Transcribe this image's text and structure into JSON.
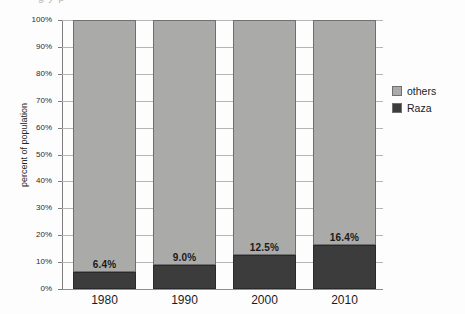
{
  "chart_data": {
    "type": "bar",
    "subtype": "stacked-bar-100",
    "title": "",
    "xlabel": "",
    "ylabel": "percent of population",
    "categories": [
      "1980",
      "1990",
      "2000",
      "2010"
    ],
    "ylim": [
      0,
      100
    ],
    "y_ticks": [
      "0%",
      "10%",
      "20%",
      "30%",
      "40%",
      "50%",
      "60%",
      "70%",
      "80%",
      "90%",
      "100%"
    ],
    "y_tick_values": [
      0,
      10,
      20,
      30,
      40,
      50,
      60,
      70,
      80,
      90,
      100
    ],
    "grid": true,
    "legend_position": "right",
    "series": [
      {
        "name": "others",
        "color": "#aaaaa9",
        "values": [
          93.6,
          91.0,
          87.5,
          83.6
        ],
        "labels": [
          "",
          "",
          "",
          ""
        ]
      },
      {
        "name": "Raza",
        "color": "#3c3c3c",
        "values": [
          6.4,
          9.0,
          12.5,
          16.4
        ],
        "labels": [
          "6.4%",
          "9.0%",
          "12.5%",
          "16.4%"
        ]
      }
    ],
    "data_labels": [
      "6.4%",
      "9.0%",
      "12.5%",
      "16.4%"
    ]
  },
  "legend": {
    "items": [
      {
        "label": "others",
        "color": "#aaaaa9"
      },
      {
        "label": "Raza",
        "color": "#3c3c3c"
      }
    ]
  },
  "axis": {
    "y_title": "percent of population"
  },
  "artifacts": {
    "top_clipped_text": "g  y  p"
  }
}
